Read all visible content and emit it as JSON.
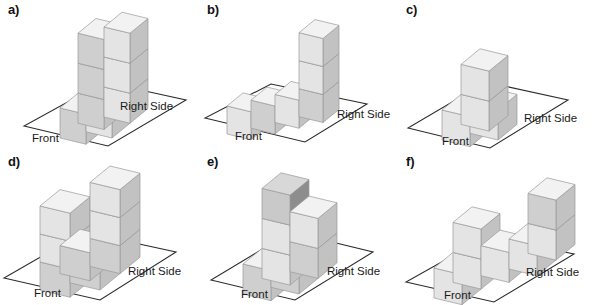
{
  "figure": {
    "axis_labels": {
      "front": "Front",
      "right_side": "Right Side"
    },
    "colors": {
      "top_face": "#f2f2f2",
      "left_face": "#e4e4e4",
      "right_face": "#c2c2c2",
      "dark_top_face": "#d8d8d8",
      "dark_left_face": "#c9c9c9",
      "dark_right_face": "#8d8d8d",
      "mid_left_face": "#cfcfcf",
      "outline": "#9a9a9a",
      "base_line": "#2b2b2b",
      "text": "#1a1a1a",
      "background": "#ffffff"
    },
    "panels": [
      {
        "id": "a",
        "label": "a)",
        "front_label": "Front",
        "right_label": "Right Side",
        "description": "three-step staircase ascending toward the back right",
        "cubes": [
          {
            "x": 0,
            "y": 0,
            "z": 0,
            "shade": "mid"
          },
          {
            "x": 1,
            "y": 0,
            "z": 0,
            "shade": "light"
          },
          {
            "x": 0,
            "y": 1,
            "z": 0,
            "shade": "mid"
          },
          {
            "x": 1,
            "y": 1,
            "z": 0,
            "shade": "light"
          },
          {
            "x": 0,
            "y": 1,
            "z": 1,
            "shade": "mid"
          },
          {
            "x": 1,
            "y": 1,
            "z": 1,
            "shade": "light"
          },
          {
            "x": 1,
            "y": 1,
            "z": 2,
            "shade": "light"
          },
          {
            "x": 0,
            "y": 1,
            "z": 2,
            "shade": "mid"
          }
        ]
      },
      {
        "id": "b",
        "label": "b)",
        "front_label": "Front",
        "right_label": "Right Side",
        "description": "row of three cubes with a three-high tower at the right end",
        "cubes": [
          {
            "x": 0,
            "y": 0,
            "z": 0,
            "shade": "light"
          },
          {
            "x": 1,
            "y": 0,
            "z": 0,
            "shade": "mid"
          },
          {
            "x": 2,
            "y": 0,
            "z": 0,
            "shade": "light"
          },
          {
            "x": 3,
            "y": 0,
            "z": 0,
            "shade": "mid"
          },
          {
            "x": 3,
            "y": 0,
            "z": 1,
            "shade": "light"
          },
          {
            "x": 3,
            "y": 0,
            "z": 2,
            "shade": "light"
          }
        ]
      },
      {
        "id": "c",
        "label": "c)",
        "front_label": "Front",
        "right_label": "Right Side",
        "description": "two cubes front left, one cube right, one cube stacked on the back cube",
        "cubes": [
          {
            "x": 0,
            "y": 0,
            "z": 0,
            "shade": "light"
          },
          {
            "x": 1,
            "y": 0,
            "z": 0,
            "shade": "light"
          },
          {
            "x": 0,
            "y": 1,
            "z": 0,
            "shade": "light"
          },
          {
            "x": 0,
            "y": 1,
            "z": 1,
            "shade": "light"
          }
        ]
      },
      {
        "id": "d",
        "label": "d)",
        "front_label": "Front",
        "right_label": "Right Side",
        "description": "solid base layer with two towers forming a U shape",
        "cubes": [
          {
            "x": 0,
            "y": 0,
            "z": 0,
            "shade": "mid"
          },
          {
            "x": 1,
            "y": 0,
            "z": 0,
            "shade": "mid"
          },
          {
            "x": 0,
            "y": 1,
            "z": 0,
            "shade": "mid"
          },
          {
            "x": 1,
            "y": 1,
            "z": 0,
            "shade": "mid"
          },
          {
            "x": 0,
            "y": 0,
            "z": 1,
            "shade": "light"
          },
          {
            "x": 0,
            "y": 0,
            "z": 2,
            "shade": "light"
          },
          {
            "x": 1,
            "y": 1,
            "z": 1,
            "shade": "light"
          },
          {
            "x": 1,
            "y": 1,
            "z": 2,
            "shade": "light"
          }
        ]
      },
      {
        "id": "e",
        "label": "e)",
        "front_label": "Front",
        "right_label": "Right Side",
        "description": "low front row with a two-high middle column topped by a dark cube and a two-high right column",
        "cubes": [
          {
            "x": 0,
            "y": 0,
            "z": 0,
            "shade": "mid"
          },
          {
            "x": 1,
            "y": 0,
            "z": 0,
            "shade": "mid"
          },
          {
            "x": 1,
            "y": 1,
            "z": 0,
            "shade": "mid"
          },
          {
            "x": 1,
            "y": 1,
            "z": 1,
            "shade": "light"
          },
          {
            "x": 0,
            "y": 1,
            "z": 0,
            "shade": "light"
          },
          {
            "x": 0,
            "y": 1,
            "z": 1,
            "shade": "light"
          },
          {
            "x": 0,
            "y": 1,
            "z": 2,
            "shade": "dark"
          }
        ]
      },
      {
        "id": "f",
        "label": "f)",
        "front_label": "Front",
        "right_label": "Right Side",
        "description": "three separated groups: a low left cube with one on top, a two-wide middle pair, and a tall right column",
        "cubes": [
          {
            "x": 0,
            "y": 0,
            "z": 0,
            "shade": "light"
          },
          {
            "x": 0,
            "y": 1,
            "z": 0,
            "shade": "light"
          },
          {
            "x": 0,
            "y": 1,
            "z": 1,
            "shade": "light"
          },
          {
            "x": 1,
            "y": 1,
            "z": 0,
            "shade": "light"
          },
          {
            "x": 2,
            "y": 1,
            "z": 0,
            "shade": "light"
          },
          {
            "x": 2,
            "y": 2,
            "z": 0,
            "shade": "light"
          },
          {
            "x": 2,
            "y": 2,
            "z": 1,
            "shade": "mid"
          }
        ]
      }
    ]
  }
}
